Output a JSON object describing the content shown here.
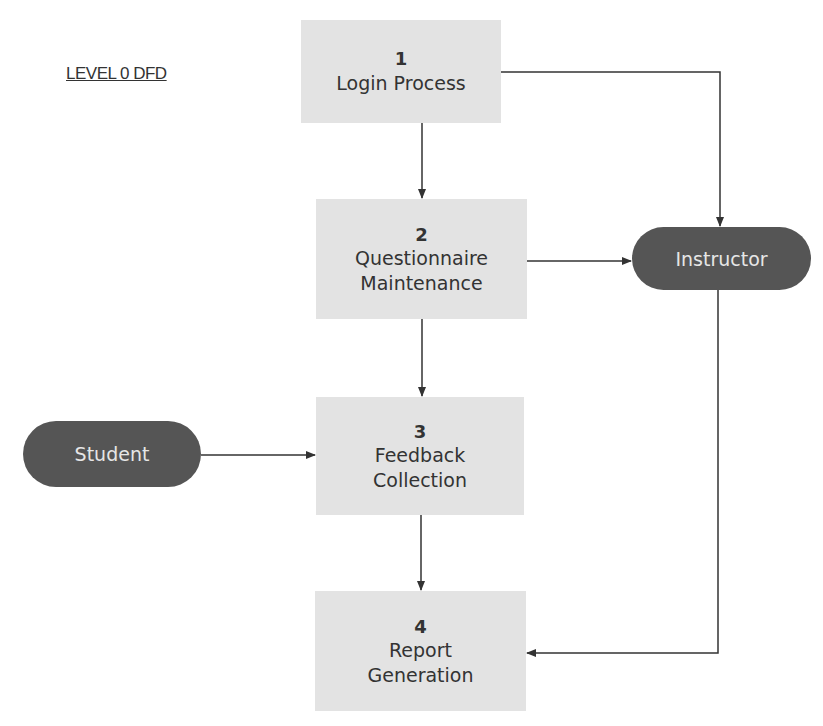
{
  "title": "LEVEL 0 DFD",
  "processes": [
    {
      "number": "1",
      "line1": "Login Process",
      "line2": ""
    },
    {
      "number": "2",
      "line1": "Questionnaire",
      "line2": "Maintenance"
    },
    {
      "number": "3",
      "line1": "Feedback",
      "line2": "Collection"
    },
    {
      "number": "4",
      "line1": "Report",
      "line2": "Generation"
    }
  ],
  "entities": {
    "instructor": "Instructor",
    "student": "Student"
  },
  "colors": {
    "process_fill": "#e3e3e3",
    "entity_fill": "#555555",
    "entity_text": "#e6e6e6",
    "line": "#333333"
  },
  "flows": [
    {
      "from": "Login Process",
      "to": "Questionnaire Maintenance"
    },
    {
      "from": "Login Process",
      "to": "Instructor"
    },
    {
      "from": "Questionnaire Maintenance",
      "to": "Instructor"
    },
    {
      "from": "Questionnaire Maintenance",
      "to": "Feedback Collection"
    },
    {
      "from": "Student",
      "to": "Feedback Collection"
    },
    {
      "from": "Feedback Collection",
      "to": "Report Generation"
    },
    {
      "from": "Instructor",
      "to": "Report Generation"
    }
  ]
}
